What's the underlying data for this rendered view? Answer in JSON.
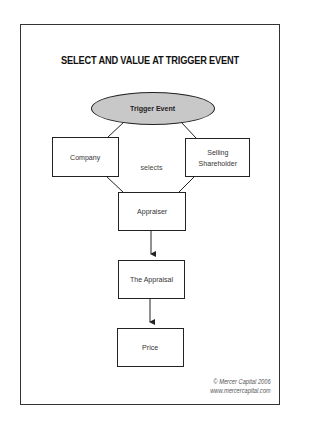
{
  "diagram": {
    "title": "SELECT AND VALUE AT TRIGGER EVENT",
    "nodes": {
      "trigger_event": "Trigger Event",
      "company": "Company",
      "selling_shareholder_line1": "Selling",
      "selling_shareholder_line2": "Shareholder",
      "appraiser": "Appraiser",
      "the_appraisal": "The Appraisal",
      "price": "Price"
    },
    "edge_labels": {
      "selects": "selects"
    },
    "edges": [
      {
        "from": "Trigger Event",
        "to": "Company",
        "type": "line"
      },
      {
        "from": "Trigger Event",
        "to": "Selling Shareholder",
        "type": "line"
      },
      {
        "from": "Company",
        "to": "Appraiser",
        "type": "line"
      },
      {
        "from": "Selling Shareholder",
        "to": "Appraiser",
        "type": "line"
      },
      {
        "from": "Appraiser",
        "to": "The Appraisal",
        "type": "arrow"
      },
      {
        "from": "The Appraisal",
        "to": "Price",
        "type": "arrow"
      }
    ],
    "colors": {
      "ellipse_fill": "#c8c8c8",
      "stroke": "#222222"
    }
  },
  "footer": {
    "copyright": "© Mercer Capital 2006",
    "url": "www.mercercapital.com"
  }
}
